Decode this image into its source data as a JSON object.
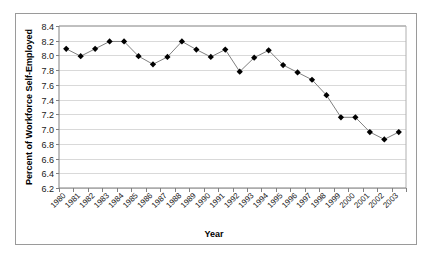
{
  "chart_data": {
    "type": "line",
    "title": "",
    "xlabel": "Year",
    "ylabel": "Percent of Workforce Self-Employed",
    "categories": [
      "1980",
      "1981",
      "1982",
      "1983",
      "1984",
      "1985",
      "1986",
      "1987",
      "1988",
      "1989",
      "1990",
      "1991",
      "1992",
      "1993",
      "1994",
      "1995",
      "1996",
      "1997",
      "1998",
      "1999",
      "2000",
      "2001",
      "2002",
      "2003"
    ],
    "values": [
      8.09,
      7.99,
      8.09,
      8.19,
      8.19,
      7.99,
      7.88,
      7.98,
      8.19,
      8.08,
      7.98,
      8.08,
      7.78,
      7.97,
      8.07,
      7.87,
      7.77,
      7.67,
      7.46,
      7.16,
      7.16,
      6.96,
      6.86,
      6.96
    ],
    "series": [
      {
        "name": "Percent of Workforce Self-Employed",
        "values": [
          8.09,
          7.99,
          8.09,
          8.19,
          8.19,
          7.99,
          7.88,
          7.98,
          8.19,
          8.08,
          7.98,
          8.08,
          7.78,
          7.97,
          8.07,
          7.87,
          7.77,
          7.67,
          7.46,
          7.16,
          7.16,
          6.96,
          6.86,
          6.96
        ]
      }
    ],
    "ylim": [
      6.2,
      8.4
    ],
    "ytick_step": 0.2,
    "ytick_labels": [
      "8.4",
      "8.2",
      "8.0",
      "7.8",
      "7.6",
      "7.4",
      "7.2",
      "7.0",
      "6.8",
      "6.6",
      "6.4",
      "6.2"
    ],
    "grid": true,
    "grid_axis": "y",
    "legend": false,
    "marker": "diamond",
    "marker_color": "#000000",
    "line_color": "#808080",
    "grid_color": "#d9d9d9",
    "axis_color": "#808080",
    "border_color": "#9a9a9a",
    "background": "#ffffff",
    "xtick_label_rotation": -45
  }
}
